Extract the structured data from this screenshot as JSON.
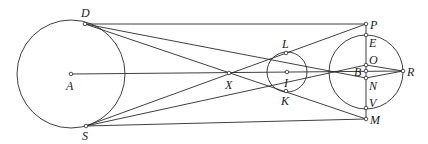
{
  "diagram": {
    "type": "geometry-construction",
    "circles": [
      {
        "name": "A",
        "cx": 71,
        "cy": 74,
        "r": 54
      },
      {
        "name": "I",
        "cx": 287,
        "cy": 72,
        "r": 20
      },
      {
        "name": "right",
        "cx": 366,
        "cy": 72,
        "r": 37
      }
    ],
    "points": {
      "A": {
        "x": 71,
        "y": 74,
        "label": "A"
      },
      "D": {
        "x": 85,
        "y": 24,
        "label": "D"
      },
      "S": {
        "x": 86,
        "y": 126,
        "label": "S"
      },
      "X": {
        "x": 229,
        "y": 73,
        "label": "X"
      },
      "I": {
        "x": 287,
        "y": 72,
        "label": "I"
      },
      "L": {
        "x": 286,
        "y": 53,
        "label": "L"
      },
      "K": {
        "x": 286,
        "y": 91,
        "label": "K"
      },
      "P": {
        "x": 366,
        "y": 24,
        "label": "P"
      },
      "E": {
        "x": 366,
        "y": 35,
        "label": "E"
      },
      "O": {
        "x": 366,
        "y": 65,
        "label": "O"
      },
      "B": {
        "x": 366,
        "y": 71,
        "label": "B"
      },
      "N": {
        "x": 366,
        "y": 78,
        "label": "N"
      },
      "V": {
        "x": 366,
        "y": 108,
        "label": "V"
      },
      "M": {
        "x": 366,
        "y": 119,
        "label": "M"
      },
      "R": {
        "x": 403,
        "y": 71,
        "label": "R"
      }
    },
    "segments": [
      [
        "A",
        "R"
      ],
      [
        "D",
        "P"
      ],
      [
        "D",
        "N"
      ],
      [
        "S",
        "O"
      ],
      [
        "S",
        "M"
      ],
      [
        "P",
        "M"
      ],
      [
        "O",
        "R"
      ],
      [
        "N",
        "R"
      ]
    ]
  }
}
